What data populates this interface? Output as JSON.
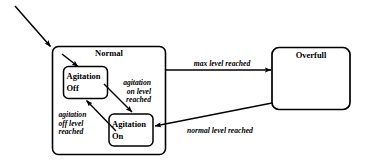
{
  "diagram": {
    "type": "uml-statechart",
    "background_color": "#ffffff",
    "line_color": "#000000",
    "states": [
      {
        "id": "normal",
        "name": "Normal",
        "kind": "composite",
        "substates": [
          {
            "id": "agitation-off",
            "name_line1": "Agitation",
            "name_line2": "Off"
          },
          {
            "id": "agitation-on",
            "name_line1": "Agitation",
            "name_line2": "On"
          }
        ]
      },
      {
        "id": "overfull",
        "name": "Overfull",
        "kind": "simple"
      }
    ],
    "transitions": [
      {
        "id": "t-initial",
        "from": "start",
        "to": "normal",
        "label": ""
      },
      {
        "id": "t-initial-inner",
        "from": "normal-entry",
        "to": "agitation-off",
        "label": ""
      },
      {
        "id": "t-max-level",
        "from": "normal",
        "to": "overfull",
        "label": "max level reached"
      },
      {
        "id": "t-normal-level",
        "from": "overfull",
        "to": "agitation-on",
        "label": "normal level reached"
      },
      {
        "id": "t-agitation-on",
        "from": "agitation-off",
        "to": "agitation-on",
        "label_line1": "agitation",
        "label_line2": "on  level",
        "label_line3": "reached"
      },
      {
        "id": "t-agitation-off",
        "from": "agitation-on",
        "to": "agitation-off",
        "label_line1": "agitation",
        "label_line2": "off level",
        "label_line3": "reached"
      }
    ]
  }
}
